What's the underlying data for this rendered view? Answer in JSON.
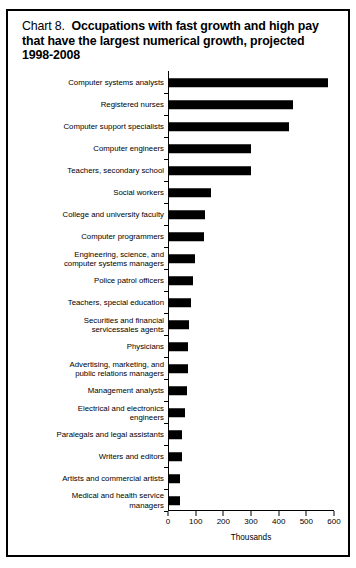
{
  "chart_data": {
    "type": "bar",
    "orientation": "horizontal",
    "title_number": "Chart 8.",
    "title": "Occupations with fast growth and high pay that have the largest numerical growth, projected 1998-2008",
    "xlabel": "Thousands",
    "ylabel": "",
    "xlim": [
      0,
      600
    ],
    "xticks": [
      0,
      100,
      200,
      300,
      400,
      500,
      600
    ],
    "xtick_labels": [
      "0",
      "100",
      "200",
      "300",
      "400",
      "500",
      "600"
    ],
    "grid": false,
    "legend": null,
    "bar_color": "#000000",
    "categories": [
      "Computer systems analysts",
      "Registered nurses",
      "Computer support specialists",
      "Computer engineers",
      "Teachers, secondary school",
      "Social workers",
      "College and university faculty",
      "Computer programmers",
      "Engineering, science, and\ncomputer systems managers",
      "Police patrol officers",
      "Teachers, special education",
      "Securities and financial\nservicessales agents",
      "Physicians",
      "Advertising, marketing, and\npublic relations managers",
      "Management analysts",
      "Electrical and electronics\nengineers",
      "Paralegals and legal assistants",
      "Writers and editors",
      "Artists and commercial artists",
      "Medical and health service\nmanagers"
    ],
    "values": [
      577,
      451,
      439,
      299,
      299,
      155,
      134,
      130,
      98,
      89,
      84,
      76,
      72,
      71,
      68,
      61,
      50,
      49,
      44,
      42
    ]
  }
}
